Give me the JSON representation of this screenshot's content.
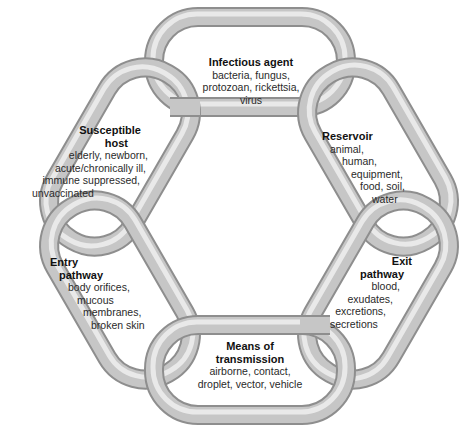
{
  "diagram": {
    "type": "chain-of-infection",
    "colors": {
      "link_fill": "#c4c4c4",
      "link_highlight": "#efefef",
      "link_shadow": "#8e8e8e",
      "text": "#2a2a2a",
      "background": "#ffffff"
    },
    "links": [
      {
        "id": "infectious-agent",
        "title": [
          "Infectious agent"
        ],
        "lines": [
          "bacteria, fungus,",
          "protozoan, rickettsia,",
          "virus"
        ]
      },
      {
        "id": "reservoir",
        "title": [
          "Reservoir"
        ],
        "lines": [
          "animal,",
          "human,",
          "equipment,",
          "food, soil,",
          "water"
        ]
      },
      {
        "id": "exit-pathway",
        "title": [
          "Exit",
          "pathway"
        ],
        "lines": [
          "blood,",
          "exudates,",
          "excretions,",
          "secretions"
        ]
      },
      {
        "id": "means-of-transmission",
        "title": [
          "Means of",
          "transmission"
        ],
        "lines": [
          "airborne, contact,",
          "droplet, vector, vehicle"
        ]
      },
      {
        "id": "entry-pathway",
        "title": [
          "Entry",
          "pathway"
        ],
        "lines": [
          "body orifices,",
          "mucous",
          "membranes,",
          "broken skin"
        ]
      },
      {
        "id": "susceptible-host",
        "title": [
          "Susceptible",
          "host"
        ],
        "lines": [
          "elderly, newborn,",
          "acute/chronically ill,",
          "immune suppressed,",
          "unvaccinated"
        ]
      }
    ]
  }
}
